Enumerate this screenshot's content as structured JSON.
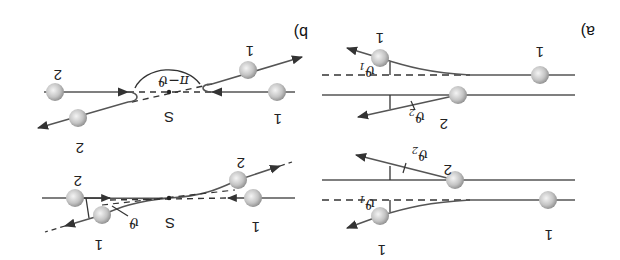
{
  "figure": {
    "orientation": "rotated 180 degrees",
    "colors": {
      "line": "#555555",
      "dashed": "#333333",
      "ball_light": "#f2f2f2",
      "ball_dark": "#8a8a8a",
      "text": "#222222"
    },
    "panel_a": {
      "label": "a)",
      "top": {
        "particle_1_in": "1",
        "particle_1_out": "1",
        "particle_2": "2",
        "angle_1": "ϑ",
        "angle_1_sub": "1",
        "angle_2": "ϑ",
        "angle_2_sub": "2"
      },
      "bottom": {
        "particle_1_in": "1",
        "particle_1_out": "1",
        "particle_2": "2",
        "angle_1": "ϑ",
        "angle_1_sub": "1",
        "angle_2": "ϑ",
        "angle_2_sub": "2"
      }
    },
    "panel_b": {
      "label": "b)",
      "top": {
        "particle_1_in": "1",
        "particle_1_out": "1",
        "particle_2_in": "2",
        "particle_2_out": "2",
        "center": "S",
        "angle": "π−ϑ"
      },
      "bottom": {
        "particle_1_in": "1",
        "particle_1_out": "1",
        "particle_2_in": "2",
        "particle_2_out": "2",
        "center": "S",
        "angle": "ϑ"
      }
    }
  }
}
